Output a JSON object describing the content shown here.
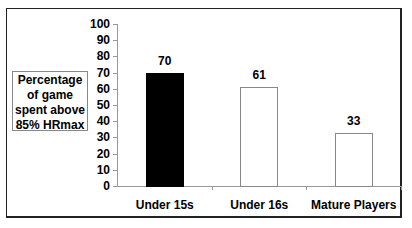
{
  "chart_data": {
    "type": "bar",
    "title": "",
    "xlabel": "",
    "ylabel": "Percentage of game spent above 85% HRmax",
    "ylabel_lines": [
      "Percentage",
      "of game",
      "spent above",
      "85% HRmax"
    ],
    "categories": [
      "Under 15s",
      "Under 16s",
      "Mature Players"
    ],
    "values": [
      70,
      61,
      33
    ],
    "bar_fills": [
      "#000000",
      "#ffffff",
      "#ffffff"
    ],
    "ylim": [
      0,
      100
    ],
    "yticks": [
      0,
      10,
      20,
      30,
      40,
      50,
      60,
      70,
      80,
      90,
      100
    ],
    "grid": false,
    "legend": null,
    "data_labels": [
      "70",
      "61",
      "33"
    ]
  }
}
